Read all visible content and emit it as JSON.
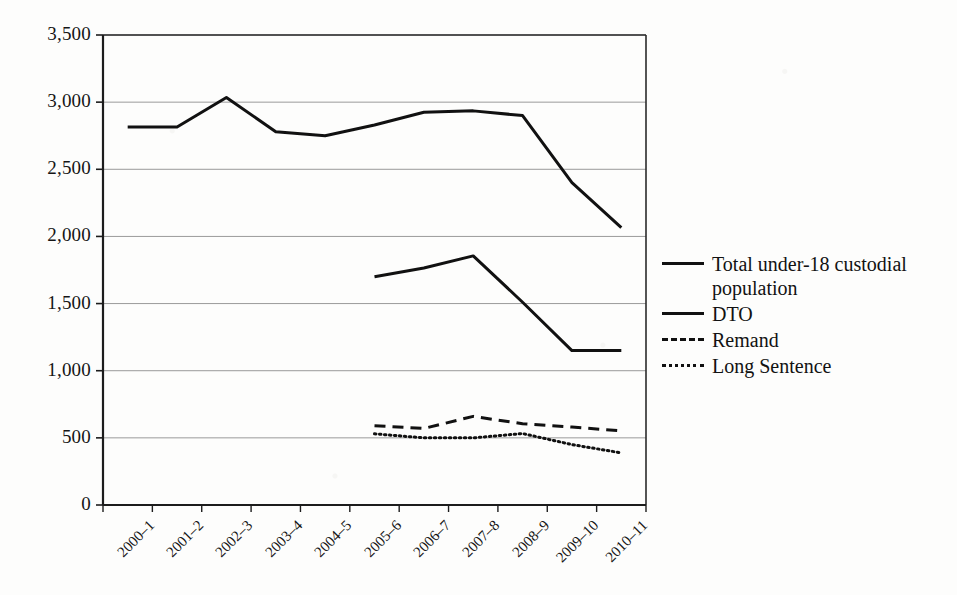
{
  "chart_data": {
    "type": "line",
    "title": "",
    "subtitle": "",
    "xlabel": "",
    "ylabel": "",
    "categories": [
      "2000–1",
      "2001–2",
      "2002–3",
      "2003–4",
      "2004–5",
      "2005–6",
      "2006–7",
      "2007–8",
      "2008–9",
      "2009–10",
      "2010–11"
    ],
    "ylim": [
      0,
      3500
    ],
    "ytick_values": [
      0,
      500,
      1000,
      1500,
      2000,
      2500,
      3000,
      3500
    ],
    "ytick_labels": [
      "0",
      "500",
      "1,000",
      "1,500",
      "2,000",
      "2,500",
      "3,000",
      "3,500"
    ],
    "grid": true,
    "grid_axis": "y",
    "legend_position": "right",
    "series": [
      {
        "name": "Total under-18 custodial population",
        "style": "solid",
        "color": "#111111",
        "width": 3,
        "values": [
          2815,
          2815,
          3035,
          2780,
          2750,
          2830,
          2925,
          2935,
          2900,
          2400,
          2065
        ]
      },
      {
        "name": "DTO",
        "style": "solid",
        "color": "#111111",
        "width": 3,
        "values": [
          null,
          null,
          null,
          null,
          null,
          1700,
          1765,
          1855,
          1510,
          1150,
          1150
        ]
      },
      {
        "name": "Remand",
        "style": "dashed",
        "color": "#111111",
        "width": 3,
        "values": [
          null,
          null,
          null,
          null,
          null,
          590,
          570,
          660,
          605,
          580,
          552
        ]
      },
      {
        "name": "Long Sentence",
        "style": "dotted",
        "color": "#111111",
        "width": 3,
        "values": [
          null,
          null,
          null,
          null,
          null,
          530,
          500,
          500,
          532,
          450,
          388
        ]
      }
    ]
  },
  "legend": {
    "entries": [
      {
        "label": "Total under-18 custodial population",
        "style": "solid"
      },
      {
        "label": "DTO",
        "style": "solid"
      },
      {
        "label": "Remand",
        "style": "dashed"
      },
      {
        "label": "Long Sentence",
        "style": "dotted"
      }
    ]
  },
  "axes": {
    "plot_left": 103,
    "plot_right": 646,
    "plot_top": 35,
    "plot_bottom": 505,
    "border_color": "#2a2a2a",
    "gridline_color": "#9a9a9a"
  }
}
